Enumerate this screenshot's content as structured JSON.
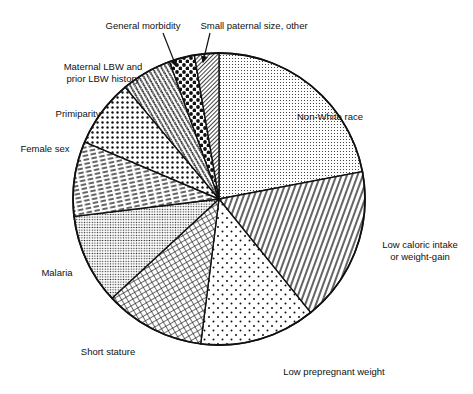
{
  "chart_data": {
    "type": "pie",
    "title": "",
    "start_angle_deg": -90,
    "direction": "clockwise",
    "center": [
      219,
      199
    ],
    "radius": 146,
    "slices": [
      {
        "label": "Non-White race",
        "value": 22.0,
        "pattern": "fine-dots",
        "label_pos": [
          330,
          120
        ],
        "label_lines": [
          "Non-White race"
        ]
      },
      {
        "label": "Low caloric intake or weight-gain",
        "value": 17.2,
        "pattern": "vertical-diag-lines",
        "label_pos": [
          420,
          248
        ],
        "label_lines": [
          "Low caloric intake",
          "or weight-gain"
        ]
      },
      {
        "label": "Low prepregnant weight",
        "value": 12.8,
        "pattern": "sparse-dots",
        "label_pos": [
          334,
          375
        ],
        "label_lines": [
          "Low prepregnant weight"
        ]
      },
      {
        "label": "Short stature",
        "value": 11.1,
        "pattern": "crosshatch",
        "label_pos": [
          108,
          355
        ],
        "label_lines": [
          "Short stature"
        ]
      },
      {
        "label": "Malaria",
        "value": 10.0,
        "pattern": "dense-dots",
        "label_pos": [
          57,
          276
        ],
        "label_lines": [
          "Malaria"
        ]
      },
      {
        "label": "Female sex",
        "value": 8.3,
        "pattern": "dashes",
        "label_pos": [
          45,
          152
        ],
        "label_lines": [
          "Female sex"
        ]
      },
      {
        "label": "Primiparity",
        "value": 7.5,
        "pattern": "medium-dots",
        "label_pos": [
          78,
          117
        ],
        "label_lines": [
          "Primiparity"
        ]
      },
      {
        "label": "Maternal LBW and prior LBW history",
        "value": 5.6,
        "pattern": "zigzag",
        "label_pos": [
          103,
          70
        ],
        "label_lines": [
          "Maternal LBW and",
          "prior LBW history"
        ]
      },
      {
        "label": "General morbidity",
        "value": 2.8,
        "pattern": "large-dots",
        "label_pos": [
          143,
          29
        ],
        "label_lines": [
          "General morbidity"
        ]
      },
      {
        "label": "Small paternal size, other",
        "value": 2.7,
        "pattern": "dense-diagonal",
        "label_pos": [
          254,
          29
        ],
        "label_lines": [
          "Small paternal size, other"
        ]
      }
    ],
    "annotations": [
      {
        "text": "General morbidity",
        "arrow_from": [
          163,
          33
        ],
        "arrow_to": [
          176,
          66
        ]
      },
      {
        "text": "Small paternal size, other",
        "arrow_from": [
          210,
          33
        ],
        "arrow_to": [
          203,
          62
        ]
      }
    ],
    "legend": "none (direct labels)"
  }
}
